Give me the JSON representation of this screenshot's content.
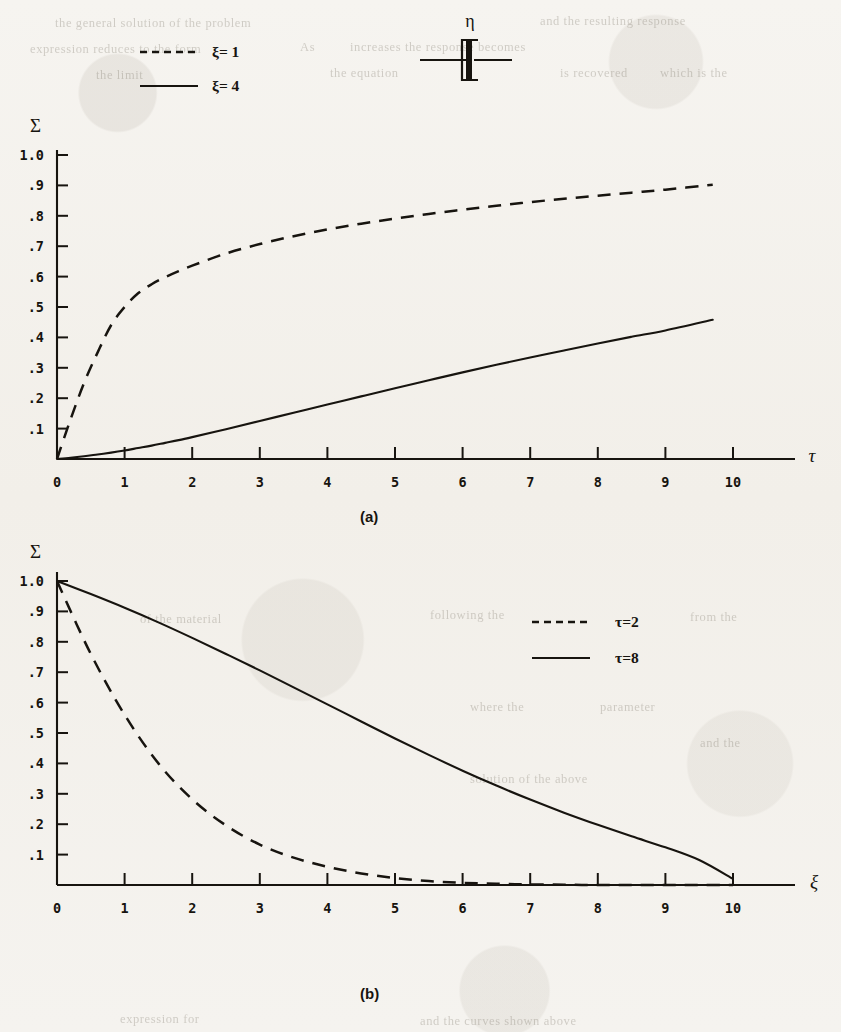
{
  "figure": {
    "ink_color": "#17140f",
    "paper_color": "#f4f2ee"
  },
  "dashpot_diagram": {
    "label": "η",
    "name": "dashpot-symbol"
  },
  "panel_a": {
    "caption": "(a)",
    "ylabel": "Σ",
    "xlabel": "τ",
    "legend": [
      {
        "style": "dashed",
        "label": "ξ= 1"
      },
      {
        "style": "solid",
        "label": "ξ= 4"
      }
    ],
    "ytick_labels": [
      "1.0",
      ".9",
      ".8",
      ".7",
      ".6",
      ".5",
      ".4",
      ".3",
      ".2",
      ".1"
    ],
    "xtick_labels": [
      "0",
      "1",
      "2",
      "3",
      "4",
      "5",
      "6",
      "7",
      "8",
      "9",
      "10"
    ]
  },
  "panel_b": {
    "caption": "(b)",
    "ylabel": "Σ",
    "xlabel": "ξ",
    "legend": [
      {
        "style": "dashed",
        "label": "τ=2"
      },
      {
        "style": "solid",
        "label": "τ=8"
      }
    ],
    "ytick_labels": [
      "1.0",
      ".9",
      ".8",
      ".7",
      ".6",
      ".5",
      ".4",
      ".3",
      ".2",
      ".1"
    ],
    "xtick_labels": [
      "0",
      "1",
      "2",
      "3",
      "4",
      "5",
      "6",
      "7",
      "8",
      "9",
      "10"
    ]
  },
  "background_text": {
    "lines": [
      {
        "text": "the general solution of the problem",
        "x": 55,
        "y": 16
      },
      {
        "text": "and the resulting response",
        "x": 540,
        "y": 14
      },
      {
        "text": "expression reduces to the form",
        "x": 30,
        "y": 42
      },
      {
        "text": "As",
        "x": 300,
        "y": 40
      },
      {
        "text": "increases the response becomes",
        "x": 350,
        "y": 40
      },
      {
        "text": "the limit",
        "x": 96,
        "y": 68
      },
      {
        "text": "the equation",
        "x": 330,
        "y": 66
      },
      {
        "text": "is recovered",
        "x": 560,
        "y": 66
      },
      {
        "text": "which is the",
        "x": 660,
        "y": 66
      },
      {
        "text": "of the material",
        "x": 140,
        "y": 612
      },
      {
        "text": "following the",
        "x": 430,
        "y": 608
      },
      {
        "text": "from the",
        "x": 690,
        "y": 610
      },
      {
        "text": "where the",
        "x": 470,
        "y": 700
      },
      {
        "text": "parameter",
        "x": 600,
        "y": 700
      },
      {
        "text": "and the",
        "x": 700,
        "y": 736
      },
      {
        "text": "solution of the above",
        "x": 470,
        "y": 772
      },
      {
        "text": "expression for",
        "x": 120,
        "y": 1012
      },
      {
        "text": "and the curves shown above",
        "x": 420,
        "y": 1014
      }
    ]
  },
  "chart_data": [
    {
      "id": "panel-a",
      "type": "line",
      "title": "(a)",
      "xlabel": "τ",
      "ylabel": "Σ",
      "xlim": [
        0,
        10
      ],
      "ylim": [
        0,
        1.0
      ],
      "grid": false,
      "legend_position": "top-left-outside",
      "x": [
        0,
        0.2,
        0.4,
        0.6,
        0.8,
        1.0,
        1.2,
        1.4,
        1.6,
        1.8,
        2.0,
        2.5,
        3.0,
        3.5,
        4.0,
        4.5,
        5.0,
        5.5,
        6.0,
        6.5,
        7.0,
        7.5,
        8.0,
        8.5,
        9.0,
        9.7
      ],
      "series": [
        {
          "name": "ξ= 1",
          "style": "dashed",
          "values": [
            0.0,
            0.13,
            0.25,
            0.35,
            0.44,
            0.5,
            0.545,
            0.575,
            0.598,
            0.618,
            0.636,
            0.676,
            0.707,
            0.733,
            0.755,
            0.774,
            0.791,
            0.806,
            0.82,
            0.833,
            0.845,
            0.856,
            0.866,
            0.876,
            0.886,
            0.902
          ]
        },
        {
          "name": "ξ= 4",
          "style": "solid",
          "values": [
            0.0,
            0.004,
            0.009,
            0.015,
            0.021,
            0.028,
            0.036,
            0.044,
            0.053,
            0.062,
            0.072,
            0.098,
            0.125,
            0.152,
            0.179,
            0.206,
            0.233,
            0.259,
            0.285,
            0.31,
            0.334,
            0.357,
            0.38,
            0.402,
            0.423,
            0.458
          ]
        }
      ]
    },
    {
      "id": "panel-b",
      "type": "line",
      "title": "(b)",
      "xlabel": "ξ",
      "ylabel": "Σ",
      "xlim": [
        0,
        10
      ],
      "ylim": [
        0,
        1.0
      ],
      "grid": false,
      "legend_position": "top-center-inside",
      "x": [
        0,
        0.5,
        1.0,
        1.5,
        2.0,
        2.5,
        3.0,
        3.5,
        4.0,
        4.5,
        5.0,
        5.5,
        6.0,
        6.5,
        7.0,
        7.5,
        8.0,
        8.5,
        9.0,
        9.5,
        10.0
      ],
      "series": [
        {
          "name": "τ=2",
          "style": "dashed",
          "values": [
            1.0,
            0.76,
            0.56,
            0.4,
            0.282,
            0.196,
            0.133,
            0.09,
            0.06,
            0.038,
            0.023,
            0.013,
            0.007,
            0.004,
            0.002,
            0.001,
            0.0,
            0.0,
            0.0,
            0.0,
            0.0
          ]
        },
        {
          "name": "τ=8",
          "style": "solid",
          "values": [
            1.0,
            0.957,
            0.912,
            0.864,
            0.813,
            0.76,
            0.706,
            0.65,
            0.594,
            0.538,
            0.482,
            0.428,
            0.376,
            0.327,
            0.281,
            0.238,
            0.198,
            0.16,
            0.124,
            0.082,
            0.02
          ]
        }
      ]
    }
  ]
}
